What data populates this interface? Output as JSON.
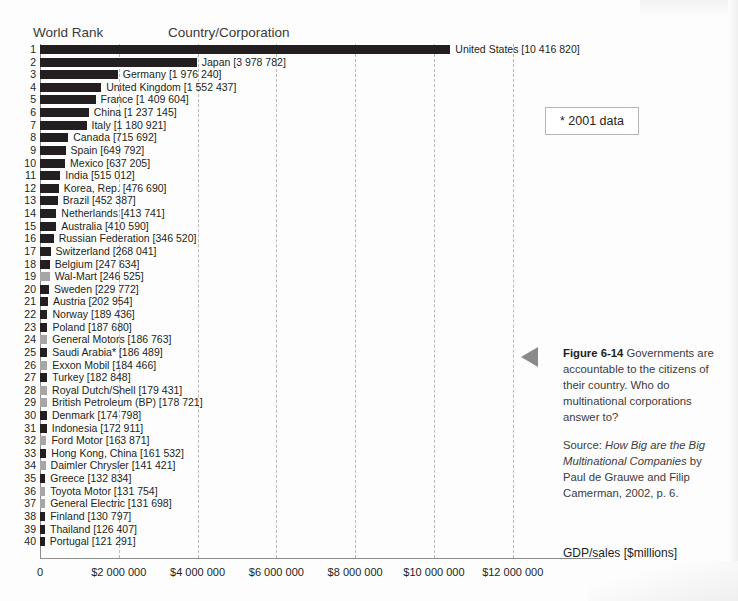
{
  "headers": {
    "rank": "World Rank",
    "country": "Country/Corporation"
  },
  "note": "* 2001 data",
  "caption": {
    "figure_number": "Figure 6-14",
    "text": " Governments are accountable to the citizens of their country. Who do multinational corporations answer to?",
    "source_prefix": "Source: ",
    "source_title": "How Big are the Big Multinational Companies",
    "source_rest": " by Paul de Grauwe and Filip Camerman, 2002, p. 6."
  },
  "colors": {
    "country_bar": "#231f20",
    "corporation_bar": "#a6a6a6",
    "gridline": "#b9b9b9",
    "axis": "#8d8d8d"
  },
  "chart_data": {
    "type": "bar",
    "orientation": "horizontal",
    "title": "",
    "xlabel": "GDP/sales [$millions]",
    "ylabel": "World Rank",
    "xlim": [
      0,
      13200000
    ],
    "grid": true,
    "legend": null,
    "xticks": [
      0,
      2000000,
      4000000,
      6000000,
      8000000,
      10000000,
      12000000
    ],
    "xtick_labels": [
      "0",
      "$2 000 000",
      "$4 000 000",
      "$6 000 000",
      "$8 000 000",
      "$10 000 000",
      "$12 000 000"
    ],
    "categories": [
      "United States",
      "Japan",
      "Germany",
      "United Kingdom",
      "France",
      "China",
      "Italy",
      "Canada",
      "Spain",
      "Mexico",
      "India",
      "Korea, Rep.",
      "Brazil",
      "Netherlands",
      "Australia",
      "Russian Federation",
      "Switzerland",
      "Belgium",
      "Wal-Mart",
      "Sweden",
      "Austria",
      "Norway",
      "Poland",
      "General Motors",
      "Saudi Arabia*",
      "Exxon Mobil",
      "Turkey",
      "Royal Dutch/Shell",
      "British Petroleum (BP)",
      "Denmark",
      "Indonesia",
      "Ford Motor",
      "Hong Kong, China",
      "Daimler Chrysler",
      "Greece",
      "Toyota Motor",
      "General Electric",
      "Finland",
      "Thailand",
      "Portugal"
    ],
    "values": [
      10416820,
      3978782,
      1976240,
      1552437,
      1409604,
      1237145,
      1180921,
      715692,
      649792,
      637205,
      515012,
      476690,
      452387,
      413741,
      410590,
      346520,
      268041,
      247634,
      246525,
      229772,
      202954,
      189436,
      187680,
      186763,
      186489,
      184466,
      182848,
      179431,
      178721,
      174798,
      172911,
      163871,
      161532,
      141421,
      132834,
      131754,
      131698,
      130797,
      126407,
      121291
    ],
    "rows": [
      {
        "rank": "1",
        "name": "United States",
        "value": 10416820,
        "value_label": "[10 416 820]",
        "kind": "country"
      },
      {
        "rank": "2",
        "name": "Japan",
        "value": 3978782,
        "value_label": "[3 978 782]",
        "kind": "country"
      },
      {
        "rank": "3",
        "name": "Germany",
        "value": 1976240,
        "value_label": "[1 976 240]",
        "kind": "country"
      },
      {
        "rank": "4",
        "name": "United Kingdom",
        "value": 1552437,
        "value_label": "[1 552 437]",
        "kind": "country"
      },
      {
        "rank": "5",
        "name": "France",
        "value": 1409604,
        "value_label": "[1 409 604]",
        "kind": "country"
      },
      {
        "rank": "6",
        "name": "China",
        "value": 1237145,
        "value_label": "[1 237 145]",
        "kind": "country"
      },
      {
        "rank": "7",
        "name": "Italy",
        "value": 1180921,
        "value_label": "[1 180 921]",
        "kind": "country"
      },
      {
        "rank": "8",
        "name": "Canada",
        "value": 715692,
        "value_label": "[715 692]",
        "kind": "country"
      },
      {
        "rank": "9",
        "name": "Spain",
        "value": 649792,
        "value_label": "[649 792]",
        "kind": "country"
      },
      {
        "rank": "10",
        "name": "Mexico",
        "value": 637205,
        "value_label": "[637 205]",
        "kind": "country"
      },
      {
        "rank": "11",
        "name": "India",
        "value": 515012,
        "value_label": "[515 012]",
        "kind": "country"
      },
      {
        "rank": "12",
        "name": "Korea, Rep.",
        "value": 476690,
        "value_label": "[476 690]",
        "kind": "country"
      },
      {
        "rank": "13",
        "name": "Brazil",
        "value": 452387,
        "value_label": "[452 387]",
        "kind": "country"
      },
      {
        "rank": "14",
        "name": "Netherlands",
        "value": 413741,
        "value_label": "[413 741]",
        "kind": "country"
      },
      {
        "rank": "15",
        "name": "Australia",
        "value": 410590,
        "value_label": "[410 590]",
        "kind": "country"
      },
      {
        "rank": "16",
        "name": "Russian Federation",
        "value": 346520,
        "value_label": "[346 520]",
        "kind": "country"
      },
      {
        "rank": "17",
        "name": "Switzerland",
        "value": 268041,
        "value_label": "[268 041]",
        "kind": "country"
      },
      {
        "rank": "18",
        "name": "Belgium",
        "value": 247634,
        "value_label": "[247 634]",
        "kind": "country"
      },
      {
        "rank": "19",
        "name": "Wal-Mart",
        "value": 246525,
        "value_label": "[246 525]",
        "kind": "corporation"
      },
      {
        "rank": "20",
        "name": "Sweden",
        "value": 229772,
        "value_label": "[229 772]",
        "kind": "country"
      },
      {
        "rank": "21",
        "name": "Austria",
        "value": 202954,
        "value_label": "[202 954]",
        "kind": "country"
      },
      {
        "rank": "22",
        "name": "Norway",
        "value": 189436,
        "value_label": "[189 436]",
        "kind": "country"
      },
      {
        "rank": "23",
        "name": "Poland",
        "value": 187680,
        "value_label": "[187 680]",
        "kind": "country"
      },
      {
        "rank": "24",
        "name": "General Motors",
        "value": 186763,
        "value_label": "[186 763]",
        "kind": "corporation"
      },
      {
        "rank": "25",
        "name": "Saudi Arabia*",
        "value": 186489,
        "value_label": "[186 489]",
        "kind": "country"
      },
      {
        "rank": "26",
        "name": "Exxon Mobil",
        "value": 184466,
        "value_label": "[184 466]",
        "kind": "corporation"
      },
      {
        "rank": "27",
        "name": "Turkey",
        "value": 182848,
        "value_label": "[182 848]",
        "kind": "country"
      },
      {
        "rank": "28",
        "name": "Royal Dutch/Shell",
        "value": 179431,
        "value_label": "[179 431]",
        "kind": "corporation"
      },
      {
        "rank": "29",
        "name": "British Petroleum (BP)",
        "value": 178721,
        "value_label": "[178 721]",
        "kind": "corporation"
      },
      {
        "rank": "30",
        "name": "Denmark",
        "value": 174798,
        "value_label": "[174 798]",
        "kind": "country"
      },
      {
        "rank": "31",
        "name": "Indonesia",
        "value": 172911,
        "value_label": "[172 911]",
        "kind": "country"
      },
      {
        "rank": "32",
        "name": "Ford Motor",
        "value": 163871,
        "value_label": "[163 871]",
        "kind": "corporation"
      },
      {
        "rank": "33",
        "name": "Hong Kong, China",
        "value": 161532,
        "value_label": "[161 532]",
        "kind": "country"
      },
      {
        "rank": "34",
        "name": "Daimler Chrysler",
        "value": 141421,
        "value_label": "[141 421]",
        "kind": "corporation"
      },
      {
        "rank": "35",
        "name": "Greece",
        "value": 132834,
        "value_label": "[132 834]",
        "kind": "country"
      },
      {
        "rank": "36",
        "name": "Toyota Motor",
        "value": 131754,
        "value_label": "[131 754]",
        "kind": "corporation"
      },
      {
        "rank": "37",
        "name": "General Electric",
        "value": 131698,
        "value_label": "[131 698]",
        "kind": "corporation"
      },
      {
        "rank": "38",
        "name": "Finland",
        "value": 130797,
        "value_label": "[130 797]",
        "kind": "country"
      },
      {
        "rank": "39",
        "name": "Thailand",
        "value": 126407,
        "value_label": "[126 407]",
        "kind": "country"
      },
      {
        "rank": "40",
        "name": "Portugal",
        "value": 121291,
        "value_label": "[121 291]",
        "kind": "country"
      }
    ]
  }
}
